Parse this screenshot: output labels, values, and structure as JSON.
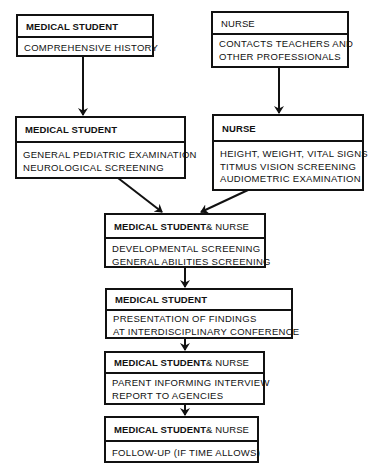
{
  "diagram": {
    "type": "flowchart",
    "nodes": [
      {
        "id": "ms-history",
        "role": "MEDICAL STUDENT",
        "role_suffix": "",
        "lines": [
          "COMPREHENSIVE HISTORY"
        ]
      },
      {
        "id": "nurse-contacts",
        "role": "NURSE",
        "role_suffix": "",
        "lines": [
          "CONTACTS TEACHERS AND",
          "OTHER PROFESSIONALS"
        ]
      },
      {
        "id": "ms-exam",
        "role": "MEDICAL STUDENT",
        "role_suffix": "",
        "lines": [
          "GENERAL PEDIATRIC EXAMINATION",
          "NEUROLOGICAL SCREENING"
        ]
      },
      {
        "id": "nurse-vitals",
        "role": "NURSE",
        "role_suffix": "",
        "lines": [
          "HEIGHT, WEIGHT, VITAL SIGNS",
          "TITMUS  VISION SCREENING",
          "AUDIOMETRIC EXAMINATION"
        ]
      },
      {
        "id": "both-screening",
        "role": "MEDICAL STUDENT",
        "role_suffix": " & NURSE",
        "lines": [
          "DEVELOPMENTAL SCREENING",
          "GENERAL ABILITIES SCREENING"
        ]
      },
      {
        "id": "ms-presentation",
        "role": "MEDICAL STUDENT",
        "role_suffix": "",
        "lines": [
          "PRESENTATION OF FINDINGS",
          "AT INTERDISCIPLINARY CONFERENCE"
        ]
      },
      {
        "id": "both-interview",
        "role": "MEDICAL STUDENT",
        "role_suffix": " & NURSE",
        "lines": [
          "PARENT INFORMING INTERVIEW",
          "REPORT TO AGENCIES"
        ]
      },
      {
        "id": "both-followup",
        "role": "MEDICAL STUDENT",
        "role_suffix": " & NURSE",
        "lines": [
          "FOLLOW-UP (IF TIME ALLOWS)"
        ]
      }
    ],
    "edges": [
      {
        "from": "ms-history",
        "to": "ms-exam"
      },
      {
        "from": "nurse-contacts",
        "to": "nurse-vitals"
      },
      {
        "from": "ms-exam",
        "to": "both-screening"
      },
      {
        "from": "nurse-vitals",
        "to": "both-screening"
      },
      {
        "from": "both-screening",
        "to": "ms-presentation"
      },
      {
        "from": "ms-presentation",
        "to": "both-interview"
      },
      {
        "from": "both-interview",
        "to": "both-followup"
      }
    ]
  }
}
